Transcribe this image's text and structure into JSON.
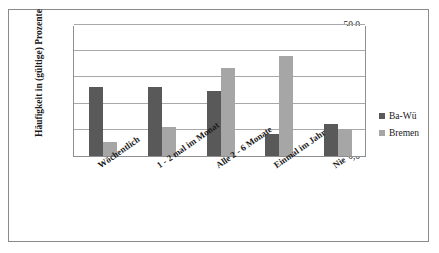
{
  "chart_data": {
    "type": "bar",
    "title": "",
    "xlabel": "",
    "ylabel": "Häufigkeit in (gültige) Prozente",
    "ylim": [
      0,
      50
    ],
    "ytick_labels": [
      "50,0",
      "40,0",
      "30,0",
      "20,0",
      "10,0",
      "0,0"
    ],
    "ytick_values": [
      50,
      40,
      30,
      20,
      10,
      0
    ],
    "grid": true,
    "legend_position": "right",
    "categories": [
      "Wöchentlich",
      "1 - 2 mal im Monat",
      "Alle 2 - 6 Monate",
      "Einmal im Jahr",
      "Nie"
    ],
    "series": [
      {
        "name": "Ba-Wü",
        "color": "#595959",
        "values": [
          26.5,
          26.4,
          25.0,
          8.5,
          12.3
        ]
      },
      {
        "name": "Bremen",
        "color": "#a6a6a6",
        "values": [
          5.5,
          11.0,
          33.5,
          38.0,
          10.4
        ]
      }
    ]
  },
  "legend": {
    "entries": [
      {
        "label": "Ba-Wü"
      },
      {
        "label": "Bremen"
      }
    ]
  }
}
